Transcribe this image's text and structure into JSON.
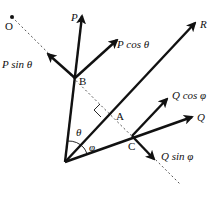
{
  "diagram": {
    "points": {
      "O": {
        "label": "O",
        "x": 12,
        "y": 17
      },
      "B": {
        "label": "B",
        "x": 75,
        "y": 78
      },
      "A": {
        "label": "A",
        "x": 108,
        "y": 112
      },
      "C": {
        "label": "C",
        "x": 132,
        "y": 136
      },
      "origin": {
        "x": 65,
        "y": 162
      }
    },
    "vectors": [
      {
        "id": "P",
        "label_main": "P",
        "label_fn": "",
        "label_angle": "",
        "from": "origin",
        "to": [
          82,
          14
        ]
      },
      {
        "id": "R",
        "label_main": "R",
        "label_fn": "",
        "label_angle": "",
        "from": "origin",
        "to": [
          196,
          21
        ]
      },
      {
        "id": "Q",
        "label_main": "Q",
        "label_fn": "",
        "label_angle": "",
        "from": "origin",
        "to": [
          194,
          116
        ]
      },
      {
        "id": "P_cos",
        "label_main": "P",
        "label_fn": "cos",
        "label_angle": "θ",
        "from": "B",
        "to": [
          118,
          39
        ]
      },
      {
        "id": "P_sin",
        "label_main": "P",
        "label_fn": "sin",
        "label_angle": "θ",
        "from": "B",
        "to": [
          47,
          53
        ]
      },
      {
        "id": "Q_cos",
        "label_main": "Q",
        "label_fn": "cos",
        "label_angle": "φ",
        "from": "C",
        "to": [
          168,
          98
        ]
      },
      {
        "id": "Q_sin",
        "label_main": "Q",
        "label_fn": "sin",
        "label_angle": "φ",
        "from": "C",
        "to": [
          155,
          160
        ]
      }
    ],
    "angles": {
      "theta": {
        "label": "θ"
      },
      "phi": {
        "label": "φ"
      }
    },
    "labels": {
      "O": "O",
      "B": "B",
      "A": "A",
      "C": "C",
      "P": "P",
      "R": "R",
      "Q": "Q",
      "P_cos": "P cos θ",
      "P_sin": "P sin θ",
      "Q_cos": "Q cos φ",
      "Q_sin": "Q sin φ",
      "theta": "θ",
      "phi": "φ"
    },
    "colors": {
      "stroke": "#111111",
      "dashed": "#555555",
      "background": "#ffffff"
    }
  }
}
